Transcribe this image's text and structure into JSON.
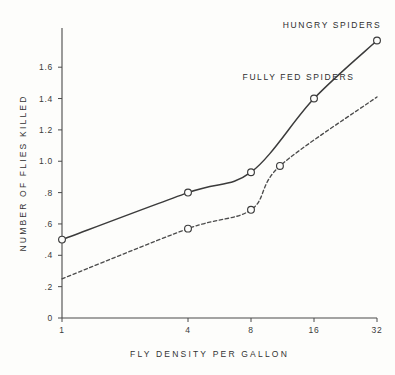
{
  "chart_data": {
    "type": "line",
    "title": "",
    "xlabel": "FLY DENSITY PER GALLON",
    "ylabel": "NUMBER OF FLIES KILLED",
    "x_scale": "log2",
    "x_ticks": [
      1,
      4,
      8,
      16,
      32
    ],
    "x_tick_labels": [
      "1",
      "4",
      "8",
      "16",
      "32"
    ],
    "xlim": [
      1,
      32
    ],
    "y_ticks": [
      0,
      0.2,
      0.4,
      0.6,
      0.8,
      1.0,
      1.2,
      1.4,
      1.6
    ],
    "y_tick_labels": [
      "0",
      ".2",
      ".4",
      ".6",
      ".8",
      "1.0",
      "1.2",
      "1.4",
      "1.6"
    ],
    "ylim": [
      0,
      1.85
    ],
    "grid": false,
    "legend_position": "inline-annotation",
    "marker": "open-circle",
    "series": [
      {
        "name": "HUNGRY SPIDERS",
        "style": "solid",
        "color": "#3b3b3b",
        "x": [
          1,
          4,
          8,
          16,
          32
        ],
        "y": [
          0.5,
          0.8,
          0.93,
          1.4,
          1.77
        ],
        "label_x": 19.5,
        "label_y": 1.85
      },
      {
        "name": "FULLY FED SPIDERS",
        "style": "dashed",
        "color": "#4c4c4c",
        "x": [
          1,
          4,
          8,
          11,
          32
        ],
        "y": [
          0.25,
          0.57,
          0.69,
          0.97,
          1.41
        ],
        "marker_x": [
          4,
          8,
          11
        ],
        "marker_y": [
          0.57,
          0.69,
          0.97
        ],
        "label_x": 13.5,
        "label_y": 1.52
      }
    ],
    "annotations": [
      {
        "text": "HUNGRY SPIDERS",
        "series": "hungry-spiders"
      },
      {
        "text": "FULLY FED SPIDERS",
        "series": "fully-fed-spiders"
      }
    ]
  }
}
